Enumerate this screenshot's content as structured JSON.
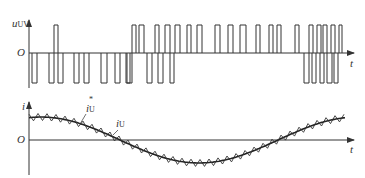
{
  "top_plot": {
    "y_label": "u",
    "y_label_sub": "UV",
    "origin_label": "O",
    "x_label": "t",
    "baseline_y": 53,
    "pos_level_y": 25,
    "neg_level_y": 83,
    "pulses_positive": [
      [
        54,
        58
      ],
      [
        132,
        136
      ],
      [
        139,
        144
      ],
      [
        155,
        159
      ],
      [
        165,
        170
      ],
      [
        175,
        180
      ],
      [
        187,
        191
      ],
      [
        197,
        202
      ],
      [
        215,
        220
      ],
      [
        228,
        233
      ],
      [
        240,
        246
      ],
      [
        256,
        260
      ],
      [
        269,
        273
      ],
      [
        277,
        281
      ],
      [
        295,
        299
      ],
      [
        309,
        313
      ],
      [
        317,
        321
      ],
      [
        323,
        327
      ],
      [
        331,
        335
      ],
      [
        339,
        342
      ]
    ],
    "pulses_negative": [
      [
        32,
        37
      ],
      [
        49,
        54
      ],
      [
        58,
        63
      ],
      [
        74,
        79
      ],
      [
        84,
        89
      ],
      [
        101,
        107
      ],
      [
        115,
        120
      ],
      [
        126,
        130
      ],
      [
        127,
        132
      ],
      [
        147,
        152
      ],
      [
        158,
        163
      ],
      [
        170,
        174
      ],
      [
        304,
        309
      ],
      [
        312,
        316
      ],
      [
        320,
        324
      ],
      [
        327,
        332
      ],
      [
        334,
        338
      ]
    ]
  },
  "bottom_plot": {
    "y_label": "i",
    "origin_label": "O",
    "x_label": "t",
    "ref_label": "i",
    "ref_label_sub": "U",
    "ref_label_sup": "*",
    "actual_label": "i",
    "actual_label_sub": "U",
    "baseline_y": 140
  },
  "colors": {
    "line": "#333333",
    "background": "#ffffff"
  }
}
